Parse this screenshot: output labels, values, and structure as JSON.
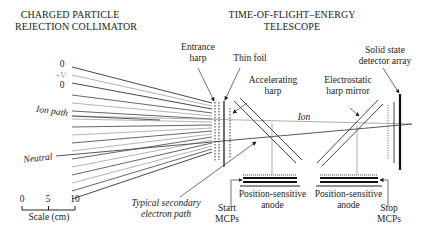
{
  "headers": {
    "collimator": [
      "CHARGED PARTICLE",
      "REJECTION COLLIMATOR"
    ],
    "telescope": [
      "TIME-OF-FLIGHT–ENERGY",
      "TELESCOPE"
    ]
  },
  "voltage_labels": [
    "0",
    "+V",
    "0"
  ],
  "labels": {
    "entrance_harp": [
      "Entrance",
      "harp"
    ],
    "thin_foil": "Thin foil",
    "accelerating_harp": [
      "Accelerating",
      "harp"
    ],
    "electrostatic_harp_mirror": [
      "Electrostatic",
      "harp mirror"
    ],
    "solid_state_detector": [
      "Solid state",
      "detector array"
    ],
    "ion_path": "Ion path",
    "neutral": "Neutral",
    "ion": "Ion",
    "secondary_electron": [
      "Typical secondary",
      "electron path"
    ],
    "start_mcps": [
      "Start",
      "MCPs"
    ],
    "stop_mcps": [
      "Stop",
      "MCPs"
    ],
    "anode_left": [
      "Position-sensitive",
      "anode"
    ],
    "anode_right": [
      "Position-sensitive",
      "anode"
    ]
  },
  "scale": {
    "ticks": [
      "0",
      "5",
      "10"
    ],
    "label": "Scale (cm)"
  },
  "colors": {
    "line_dark": "#222222",
    "line_light": "#9a9a9a",
    "background": "#ffffff"
  }
}
